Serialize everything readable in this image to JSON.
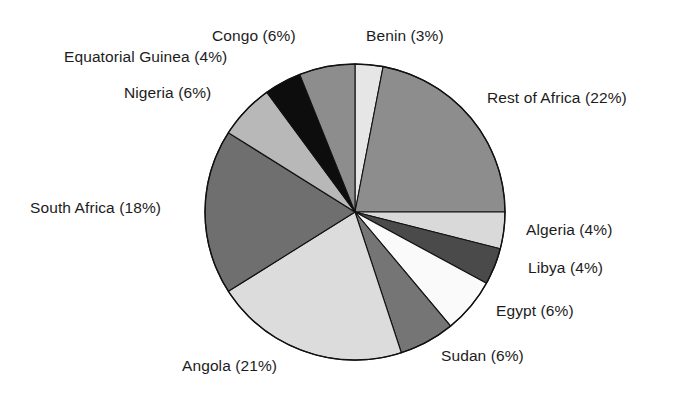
{
  "chart_data": {
    "type": "pie",
    "title": "",
    "subtitle": "",
    "xlabel": "",
    "ylabel": "",
    "legend_position": "none",
    "grid": false,
    "label_format": "{name} ({value}%)",
    "start_angle_deg": 0,
    "direction": "clockwise",
    "units": "percent",
    "total": 100,
    "categories": [
      "Benin",
      "Rest of Africa",
      "Algeria",
      "Libya",
      "Egypt",
      "Sudan",
      "Angola",
      "South Africa",
      "Nigeria",
      "Equatorial Guinea",
      "Congo"
    ],
    "values": [
      3,
      22,
      4,
      4,
      6,
      6,
      21,
      18,
      6,
      4,
      6
    ],
    "slices": [
      {
        "name": "Benin",
        "value": 3,
        "label": "Benin (3%)",
        "color": "#e6e6e6"
      },
      {
        "name": "Rest of Africa",
        "value": 22,
        "label": "Rest of Africa (22%)",
        "color": "#8d8d8d"
      },
      {
        "name": "Algeria",
        "value": 4,
        "label": "Algeria (4%)",
        "color": "#d9d9d9"
      },
      {
        "name": "Libya",
        "value": 4,
        "label": "Libya (4%)",
        "color": "#4a4a4a"
      },
      {
        "name": "Egypt",
        "value": 6,
        "label": "Egypt (6%)",
        "color": "#fafafa"
      },
      {
        "name": "Sudan",
        "value": 6,
        "label": "Sudan (6%)",
        "color": "#757575"
      },
      {
        "name": "Angola",
        "value": 21,
        "label": "Angola (21%)",
        "color": "#dcdcdc"
      },
      {
        "name": "South Africa",
        "value": 18,
        "label": "South Africa (18%)",
        "color": "#6f6f6f"
      },
      {
        "name": "Nigeria",
        "value": 6,
        "label": "Nigeria (6%)",
        "color": "#b8b8b8"
      },
      {
        "name": "Equatorial Guinea",
        "value": 4,
        "label": "Equatorial Guinea (4%)",
        "color": "#0d0d0d"
      },
      {
        "name": "Congo",
        "value": 6,
        "label": "Congo (6%)",
        "color": "#8d8d8d"
      }
    ],
    "geometry": {
      "center_x": 355,
      "center_y": 212,
      "radius_x": 150,
      "radius_y": 148
    }
  },
  "labels": {
    "benin": "Benin (3%)",
    "rest_of_africa": "Rest of Africa (22%)",
    "algeria": "Algeria (4%)",
    "libya": "Libya (4%)",
    "egypt": "Egypt (6%)",
    "sudan": "Sudan (6%)",
    "angola": "Angola (21%)",
    "south_africa": "South Africa (18%)",
    "nigeria": "Nigeria (6%)",
    "equatorial_guinea": "Equatorial Guinea (4%)",
    "congo": "Congo (6%)"
  }
}
